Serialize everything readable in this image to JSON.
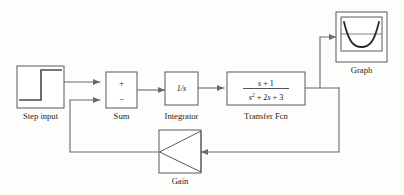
{
  "diagram": {
    "background_color": "#fdfdfc",
    "line_color": "#6b6b6b",
    "block_stroke_color": "#595959",
    "text_color": "#1a1a1a"
  },
  "blocks": {
    "step_input": {
      "label": "Step input",
      "icon": "step-waveform-icon",
      "type": "source"
    },
    "sum": {
      "label": "Sum",
      "plus_sign": "+",
      "minus_sign": "−",
      "type": "summing-junction"
    },
    "integrator": {
      "label": "Integrator",
      "expression": "1/s",
      "numerator": "1",
      "denominator": "s",
      "type": "transfer-block"
    },
    "transfer_fcn": {
      "label": "Transfer Fcn",
      "numerator": "s + 1",
      "numerator_parts": {
        "var": "s",
        "op": "+",
        "const": "1"
      },
      "denominator": "s^2 + 2s + 3",
      "denominator_parts": {
        "term1_var": "s",
        "term1_exp": "2",
        "op1": "+",
        "term2_coef": "2",
        "term2_var": "s",
        "op2": "+",
        "term3_const": "3"
      },
      "type": "transfer-block"
    },
    "gain": {
      "label": "Gain",
      "icon": "triangle-left-icon",
      "type": "gain-block"
    },
    "graph": {
      "label": "Graph",
      "icon": "scope-waveform-icon",
      "type": "sink"
    }
  },
  "signal_flow": [
    {
      "from": "step_input",
      "to": "sum",
      "port": "plus"
    },
    {
      "from": "sum",
      "to": "integrator",
      "port": "in"
    },
    {
      "from": "integrator",
      "to": "transfer_fcn",
      "port": "in"
    },
    {
      "from": "transfer_fcn",
      "to": "graph",
      "port": "in"
    },
    {
      "from": "transfer_fcn",
      "to": "gain",
      "port": "in"
    },
    {
      "from": "gain",
      "to": "sum",
      "port": "minus"
    }
  ]
}
